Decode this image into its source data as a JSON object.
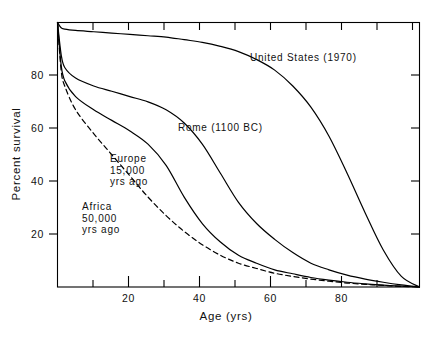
{
  "chart_data": {
    "type": "line",
    "title": "",
    "xlabel": "Age (yrs)",
    "ylabel": "Percent survival",
    "xlim": [
      0,
      100
    ],
    "ylim": [
      0,
      100
    ],
    "grid": false,
    "legend_position": "inline-annotations",
    "xticks_major": [
      20,
      40,
      60,
      80
    ],
    "xticks_minor": [
      10,
      30,
      50,
      70,
      90
    ],
    "yticks_major": [
      20,
      40,
      60,
      80
    ],
    "xtick_labels": [
      "20",
      "40",
      "60",
      "80"
    ],
    "ytick_labels": [
      "20",
      "40",
      "60",
      "80"
    ],
    "series": [
      {
        "name": "United States (1970)",
        "style": "solid",
        "color": "#000000",
        "label_text": "United States  (1970)",
        "x": [
          0,
          1,
          2,
          5,
          10,
          15,
          20,
          25,
          30,
          35,
          40,
          45,
          50,
          55,
          60,
          65,
          70,
          75,
          80,
          85,
          90,
          95,
          100
        ],
        "y": [
          100,
          98,
          97.5,
          97,
          96.5,
          96,
          95.5,
          95,
          94.5,
          93.5,
          92.5,
          91,
          89,
          86,
          82,
          76,
          68,
          57,
          43,
          28,
          14,
          4,
          0
        ]
      },
      {
        "name": "Rome (1100 BC)",
        "style": "solid",
        "color": "#000000",
        "label_text": "Rome  (1100 BC)",
        "x": [
          0,
          1,
          2,
          5,
          10,
          15,
          20,
          25,
          30,
          35,
          40,
          45,
          50,
          55,
          60,
          65,
          70,
          75,
          80,
          85,
          90,
          95,
          100
        ],
        "y": [
          100,
          88,
          83,
          79,
          76,
          74,
          72,
          70,
          67,
          62,
          54,
          43,
          32,
          24,
          18,
          13,
          9,
          6.5,
          4.5,
          3,
          1.8,
          0.8,
          0
        ]
      },
      {
        "name": "Europe 15,000 yrs ago",
        "style": "solid",
        "color": "#000000",
        "label_text": "Europe\n15,000\nyrs ago",
        "label_lines": [
          "Europe",
          "15,000",
          "yrs  ago"
        ],
        "x": [
          0,
          1,
          2,
          5,
          10,
          15,
          20,
          25,
          30,
          35,
          40,
          45,
          50,
          55,
          60,
          65,
          70,
          75,
          80,
          85,
          90,
          95,
          100
        ],
        "y": [
          100,
          84,
          78,
          72,
          67,
          63,
          59,
          54,
          46,
          34,
          24,
          17,
          12,
          9,
          6.5,
          5,
          3.6,
          2.6,
          1.8,
          1.2,
          0.7,
          0.3,
          0
        ]
      },
      {
        "name": "Africa 50,000 yrs ago",
        "style": "dashed",
        "color": "#000000",
        "label_text": "Africa\n50,000\nyrs ago",
        "label_lines": [
          "Africa",
          "50,000",
          "yrs  ago"
        ],
        "x": [
          0,
          1,
          2,
          5,
          10,
          15,
          20,
          25,
          30,
          35,
          40,
          45,
          50,
          55,
          60,
          65,
          70,
          75,
          80,
          85,
          90,
          95,
          100
        ],
        "y": [
          100,
          82,
          76,
          67,
          58,
          50,
          42,
          34,
          27,
          21,
          16,
          12,
          9,
          7,
          5.2,
          4,
          3,
          2.2,
          1.5,
          1,
          0.6,
          0.25,
          0
        ]
      }
    ]
  },
  "axes": {
    "ylabel": "Percent survival",
    "xlabel": "Age (yrs)",
    "ytick_20": "20",
    "ytick_40": "40",
    "ytick_60": "60",
    "ytick_80": "80",
    "xtick_20": "20",
    "xtick_40": "40",
    "xtick_60": "60",
    "xtick_80": "80"
  },
  "annotations": {
    "united_states": "United States  (1970)",
    "rome": "Rome  (1100 BC)",
    "europe_line1": "Europe",
    "europe_line2": "15,000",
    "europe_line3": "yrs  ago",
    "africa_line1": "Africa",
    "africa_line2": "50,000",
    "africa_line3": "yrs  ago"
  }
}
